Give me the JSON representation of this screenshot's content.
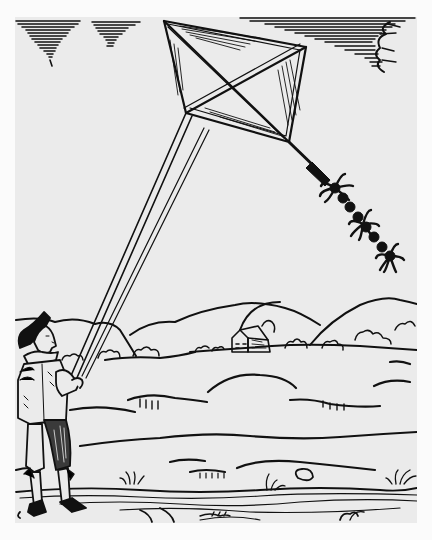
{
  "artwork": {
    "style": "woodcut illustration",
    "subject": "man flying a diamond-shaped kite over a rolling landscape",
    "colors": {
      "paper": "#ebebeb",
      "ink": "#111111",
      "margin": "#fbfbfb"
    },
    "elements": [
      {
        "name": "kite",
        "description": "diamond kite with crossed spars and hatched panels"
      },
      {
        "name": "kite-tail",
        "description": "tail with knotted bows and tufts"
      },
      {
        "name": "kite-string",
        "description": "double-lined string from kite to man"
      },
      {
        "name": "man",
        "description": "man in brimmed hat, ruff collar, doublet and breeches holding the string"
      },
      {
        "name": "clouds",
        "description": "hatched clouds in top left and top right"
      },
      {
        "name": "hills",
        "description": "rolling hills with bushes and a distant house"
      },
      {
        "name": "ground",
        "description": "wavy foreground with grass tufts and stones"
      }
    ]
  }
}
